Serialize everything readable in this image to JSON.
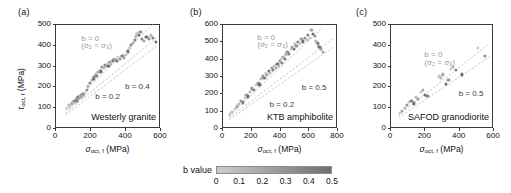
{
  "figure": {
    "background": "#ffffff",
    "point_color_min": "#c9c9c9",
    "point_color_max": "#6f6f6f",
    "trendline_color": "#b5b5b5",
    "axis_color": "#3a3a3a"
  },
  "colorbar": {
    "label": "b value",
    "ticks": [
      "0",
      "0.1",
      "0.2",
      "0.3",
      "0.4",
      "0.5"
    ],
    "values": [
      0,
      0.1,
      0.2,
      0.3,
      0.4,
      0.5
    ],
    "gradient_start": "#cccccc",
    "gradient_end": "#6e6e6e"
  },
  "axis_titles": {
    "x_prefix": "σ",
    "x_sub": "oct, f",
    "x_units": "(MPa)",
    "y_prefix": "τ",
    "y_sub": "oct, f",
    "y_units": "(MPa)"
  },
  "chart_data": [
    {
      "type": "scatter",
      "panel": "(a)",
      "title": "Westerly granite",
      "xlabel": "σoct, f (MPa)",
      "ylabel": "τoct, f (MPa)",
      "xlim": [
        0,
        600
      ],
      "ylim": [
        0,
        500
      ],
      "xticks": [
        0,
        200,
        400,
        600
      ],
      "yticks": [
        0,
        100,
        200,
        300,
        400,
        500
      ],
      "grid": false,
      "legend": "colorbar: b value",
      "colorbar_range": [
        0,
        0.5
      ],
      "annotations": [
        {
          "text": "b = 0",
          "x": 150,
          "y": 430,
          "color": "#9a9a9a"
        },
        {
          "text": "(σ₂ = σ₃)",
          "x": 150,
          "y": 392,
          "color": "#9a9a9a"
        },
        {
          "text": "b = 0.2",
          "x": 230,
          "y": 150,
          "color": "#3c3c3c"
        },
        {
          "text": "b = 0.4",
          "x": 400,
          "y": 195,
          "color": "#3c3c3c"
        }
      ],
      "trendlines": [
        {
          "label": "b = 0",
          "x0": 60,
          "y0": 85,
          "x1": 560,
          "y1": 500
        },
        {
          "label": "b = 0.2",
          "x0": 60,
          "y0": 72,
          "x1": 590,
          "y1": 440
        },
        {
          "label": "b = 0.4",
          "x0": 60,
          "y0": 62,
          "x1": 590,
          "y1": 400
        }
      ],
      "points": [
        {
          "x": 70,
          "y": 95,
          "b": 0.0
        },
        {
          "x": 78,
          "y": 110,
          "b": 0.1
        },
        {
          "x": 85,
          "y": 103,
          "b": 0.0
        },
        {
          "x": 95,
          "y": 118,
          "b": 0.2
        },
        {
          "x": 100,
          "y": 125,
          "b": 0.1
        },
        {
          "x": 108,
          "y": 130,
          "b": 0.3
        },
        {
          "x": 112,
          "y": 122,
          "b": 0.0
        },
        {
          "x": 118,
          "y": 140,
          "b": 0.2
        },
        {
          "x": 122,
          "y": 132,
          "b": 0.4
        },
        {
          "x": 126,
          "y": 145,
          "b": 0.1
        },
        {
          "x": 130,
          "y": 138,
          "b": 0.3
        },
        {
          "x": 134,
          "y": 150,
          "b": 0.5
        },
        {
          "x": 138,
          "y": 143,
          "b": 0.2
        },
        {
          "x": 142,
          "y": 155,
          "b": 0.0
        },
        {
          "x": 146,
          "y": 148,
          "b": 0.4
        },
        {
          "x": 150,
          "y": 160,
          "b": 0.3
        },
        {
          "x": 155,
          "y": 152,
          "b": 0.1
        },
        {
          "x": 160,
          "y": 165,
          "b": 0.5
        },
        {
          "x": 165,
          "y": 158,
          "b": 0.2
        },
        {
          "x": 170,
          "y": 170,
          "b": 0.0
        },
        {
          "x": 180,
          "y": 185,
          "b": 0.3
        },
        {
          "x": 190,
          "y": 200,
          "b": 0.1
        },
        {
          "x": 200,
          "y": 215,
          "b": 0.4
        },
        {
          "x": 210,
          "y": 230,
          "b": 0.2
        },
        {
          "x": 215,
          "y": 245,
          "b": 0.0
        },
        {
          "x": 222,
          "y": 238,
          "b": 0.5
        },
        {
          "x": 228,
          "y": 252,
          "b": 0.3
        },
        {
          "x": 235,
          "y": 262,
          "b": 0.1
        },
        {
          "x": 240,
          "y": 250,
          "b": 0.4
        },
        {
          "x": 248,
          "y": 268,
          "b": 0.2
        },
        {
          "x": 255,
          "y": 280,
          "b": 0.0
        },
        {
          "x": 262,
          "y": 272,
          "b": 0.5
        },
        {
          "x": 270,
          "y": 295,
          "b": 0.3
        },
        {
          "x": 278,
          "y": 288,
          "b": 0.1
        },
        {
          "x": 285,
          "y": 305,
          "b": 0.4
        },
        {
          "x": 292,
          "y": 298,
          "b": 0.2
        },
        {
          "x": 300,
          "y": 312,
          "b": 0.0
        },
        {
          "x": 305,
          "y": 300,
          "b": 0.5
        },
        {
          "x": 312,
          "y": 318,
          "b": 0.3
        },
        {
          "x": 320,
          "y": 308,
          "b": 0.1
        },
        {
          "x": 330,
          "y": 325,
          "b": 0.4
        },
        {
          "x": 340,
          "y": 330,
          "b": 0.2
        },
        {
          "x": 352,
          "y": 322,
          "b": 0.5
        },
        {
          "x": 360,
          "y": 340,
          "b": 0.0
        },
        {
          "x": 372,
          "y": 332,
          "b": 0.3
        },
        {
          "x": 385,
          "y": 345,
          "b": 0.4
        },
        {
          "x": 395,
          "y": 338,
          "b": 0.2
        },
        {
          "x": 405,
          "y": 352,
          "b": 0.1
        },
        {
          "x": 418,
          "y": 368,
          "b": 0.5
        },
        {
          "x": 425,
          "y": 385,
          "b": 0.0
        },
        {
          "x": 435,
          "y": 398,
          "b": 0.3
        },
        {
          "x": 445,
          "y": 410,
          "b": 0.2
        },
        {
          "x": 455,
          "y": 425,
          "b": 0.4
        },
        {
          "x": 462,
          "y": 440,
          "b": 0.1
        },
        {
          "x": 470,
          "y": 455,
          "b": 0.0
        },
        {
          "x": 478,
          "y": 448,
          "b": 0.5
        },
        {
          "x": 488,
          "y": 462,
          "b": 0.3
        },
        {
          "x": 498,
          "y": 430,
          "b": 0.4
        },
        {
          "x": 510,
          "y": 418,
          "b": 0.2
        },
        {
          "x": 522,
          "y": 438,
          "b": 0.5
        },
        {
          "x": 535,
          "y": 428,
          "b": 0.3
        },
        {
          "x": 548,
          "y": 445,
          "b": 0.1
        },
        {
          "x": 560,
          "y": 435,
          "b": 0.4
        },
        {
          "x": 575,
          "y": 412,
          "b": 0.5
        }
      ]
    },
    {
      "type": "scatter",
      "panel": "(b)",
      "title": "KTB amphibolite",
      "xlabel": "σoct, f (MPa)",
      "ylabel": "τoct, f (MPa)",
      "xlim": [
        0,
        800
      ],
      "ylim": [
        0,
        600
      ],
      "xticks": [
        0,
        200,
        400,
        600,
        800
      ],
      "yticks": [
        0,
        100,
        200,
        300,
        400,
        500,
        600
      ],
      "grid": false,
      "legend": "colorbar: b value",
      "colorbar_range": [
        0,
        0.5
      ],
      "annotations": [
        {
          "text": "b = 0",
          "x": 245,
          "y": 520,
          "color": "#9a9a9a"
        },
        {
          "text": "(σ₂ = σ₃)",
          "x": 245,
          "y": 478,
          "color": "#9a9a9a"
        },
        {
          "text": "b = 0.2",
          "x": 330,
          "y": 135,
          "color": "#3c3c3c"
        },
        {
          "text": "b = 0.5",
          "x": 555,
          "y": 232,
          "color": "#3c3c3c"
        }
      ],
      "trendlines": [
        {
          "label": "b = 0",
          "x0": 50,
          "y0": 70,
          "x1": 700,
          "y1": 580
        },
        {
          "label": "b = 0.2",
          "x0": 50,
          "y0": 58,
          "x1": 780,
          "y1": 520
        },
        {
          "label": "b = 0.5",
          "x0": 50,
          "y0": 48,
          "x1": 780,
          "y1": 470
        }
      ],
      "points": [
        {
          "x": 55,
          "y": 78,
          "b": 0.0
        },
        {
          "x": 70,
          "y": 92,
          "b": 0.1
        },
        {
          "x": 90,
          "y": 110,
          "b": 0.0
        },
        {
          "x": 105,
          "y": 125,
          "b": 0.2
        },
        {
          "x": 118,
          "y": 140,
          "b": 0.1
        },
        {
          "x": 130,
          "y": 155,
          "b": 0.3
        },
        {
          "x": 145,
          "y": 148,
          "b": 0.4
        },
        {
          "x": 158,
          "y": 172,
          "b": 0.0
        },
        {
          "x": 170,
          "y": 190,
          "b": 0.2
        },
        {
          "x": 182,
          "y": 182,
          "b": 0.5
        },
        {
          "x": 195,
          "y": 210,
          "b": 0.1
        },
        {
          "x": 210,
          "y": 228,
          "b": 0.3
        },
        {
          "x": 222,
          "y": 218,
          "b": 0.4
        },
        {
          "x": 235,
          "y": 248,
          "b": 0.0
        },
        {
          "x": 248,
          "y": 262,
          "b": 0.2
        },
        {
          "x": 260,
          "y": 252,
          "b": 0.5
        },
        {
          "x": 272,
          "y": 282,
          "b": 0.1
        },
        {
          "x": 285,
          "y": 298,
          "b": 0.3
        },
        {
          "x": 295,
          "y": 288,
          "b": 0.4
        },
        {
          "x": 305,
          "y": 315,
          "b": 0.0
        },
        {
          "x": 315,
          "y": 305,
          "b": 0.2
        },
        {
          "x": 325,
          "y": 330,
          "b": 0.5
        },
        {
          "x": 335,
          "y": 320,
          "b": 0.1
        },
        {
          "x": 345,
          "y": 345,
          "b": 0.3
        },
        {
          "x": 355,
          "y": 335,
          "b": 0.4
        },
        {
          "x": 365,
          "y": 358,
          "b": 0.0
        },
        {
          "x": 375,
          "y": 348,
          "b": 0.2
        },
        {
          "x": 385,
          "y": 370,
          "b": 0.5
        },
        {
          "x": 395,
          "y": 360,
          "b": 0.1
        },
        {
          "x": 400,
          "y": 385,
          "b": 0.3
        },
        {
          "x": 408,
          "y": 398,
          "b": 0.0
        },
        {
          "x": 415,
          "y": 375,
          "b": 0.4
        },
        {
          "x": 425,
          "y": 410,
          "b": 0.2
        },
        {
          "x": 435,
          "y": 398,
          "b": 0.5
        },
        {
          "x": 445,
          "y": 425,
          "b": 0.1
        },
        {
          "x": 455,
          "y": 440,
          "b": 0.3
        },
        {
          "x": 465,
          "y": 428,
          "b": 0.4
        },
        {
          "x": 478,
          "y": 455,
          "b": 0.0
        },
        {
          "x": 488,
          "y": 470,
          "b": 0.2
        },
        {
          "x": 498,
          "y": 458,
          "b": 0.5
        },
        {
          "x": 508,
          "y": 485,
          "b": 0.1
        },
        {
          "x": 518,
          "y": 472,
          "b": 0.3
        },
        {
          "x": 528,
          "y": 498,
          "b": 0.4
        },
        {
          "x": 540,
          "y": 488,
          "b": 0.0
        },
        {
          "x": 552,
          "y": 512,
          "b": 0.2
        },
        {
          "x": 562,
          "y": 500,
          "b": 0.5
        },
        {
          "x": 575,
          "y": 520,
          "b": 0.3
        },
        {
          "x": 588,
          "y": 508,
          "b": 0.1
        },
        {
          "x": 600,
          "y": 535,
          "b": 0.4
        },
        {
          "x": 612,
          "y": 522,
          "b": 0.0
        },
        {
          "x": 622,
          "y": 568,
          "b": 0.2
        },
        {
          "x": 632,
          "y": 545,
          "b": 0.5
        },
        {
          "x": 645,
          "y": 530,
          "b": 0.3
        },
        {
          "x": 655,
          "y": 500,
          "b": 0.1
        },
        {
          "x": 668,
          "y": 488,
          "b": 0.4
        },
        {
          "x": 678,
          "y": 470,
          "b": 0.5
        },
        {
          "x": 690,
          "y": 455,
          "b": 0.3
        },
        {
          "x": 700,
          "y": 440,
          "b": 0.2
        }
      ]
    },
    {
      "type": "scatter",
      "panel": "(c)",
      "title": "SAFOD granodiorite",
      "xlabel": "σoct, f (MPa)",
      "ylabel": "τoct, f (MPa)",
      "xlim": [
        0,
        600
      ],
      "ylim": [
        0,
        500
      ],
      "xticks": [
        0,
        200,
        400,
        600
      ],
      "yticks": [
        0,
        100,
        200,
        300,
        400,
        500
      ],
      "grid": false,
      "legend": "colorbar: b value",
      "colorbar_range": [
        0,
        0.5
      ],
      "annotations": [
        {
          "text": "b = 0",
          "x": 200,
          "y": 352,
          "color": "#9a9a9a"
        },
        {
          "text": "(σ₂ = σ₃)",
          "x": 200,
          "y": 312,
          "color": "#9a9a9a"
        },
        {
          "text": "b = 0.5",
          "x": 400,
          "y": 165,
          "color": "#3c3c3c"
        }
      ],
      "trendlines": [
        {
          "label": "b = 0",
          "x0": 50,
          "y0": 62,
          "x1": 570,
          "y1": 400
        },
        {
          "label": "b = 0.5",
          "x0": 50,
          "y0": 50,
          "x1": 585,
          "y1": 345
        }
      ],
      "points": [
        {
          "x": 58,
          "y": 72,
          "b": 0.0
        },
        {
          "x": 68,
          "y": 82,
          "b": 0.2
        },
        {
          "x": 85,
          "y": 98,
          "b": 0.1
        },
        {
          "x": 100,
          "y": 112,
          "b": 0.3
        },
        {
          "x": 112,
          "y": 125,
          "b": 0.0
        },
        {
          "x": 125,
          "y": 132,
          "b": 0.4
        },
        {
          "x": 138,
          "y": 118,
          "b": 0.5
        },
        {
          "x": 150,
          "y": 148,
          "b": 0.1
        },
        {
          "x": 162,
          "y": 138,
          "b": 0.3
        },
        {
          "x": 178,
          "y": 172,
          "b": 0.0
        },
        {
          "x": 192,
          "y": 182,
          "b": 0.2
        },
        {
          "x": 205,
          "y": 160,
          "b": 0.5
        },
        {
          "x": 218,
          "y": 155,
          "b": 0.4
        },
        {
          "x": 288,
          "y": 248,
          "b": 0.0
        },
        {
          "x": 298,
          "y": 242,
          "b": 0.1
        },
        {
          "x": 310,
          "y": 258,
          "b": 0.2
        },
        {
          "x": 328,
          "y": 212,
          "b": 0.5
        },
        {
          "x": 340,
          "y": 232,
          "b": 0.3
        },
        {
          "x": 355,
          "y": 285,
          "b": 0.0
        },
        {
          "x": 368,
          "y": 292,
          "b": 0.1
        },
        {
          "x": 382,
          "y": 278,
          "b": 0.4
        },
        {
          "x": 418,
          "y": 258,
          "b": 0.5
        },
        {
          "x": 512,
          "y": 385,
          "b": 0.0
        },
        {
          "x": 552,
          "y": 348,
          "b": 0.3
        }
      ]
    }
  ]
}
